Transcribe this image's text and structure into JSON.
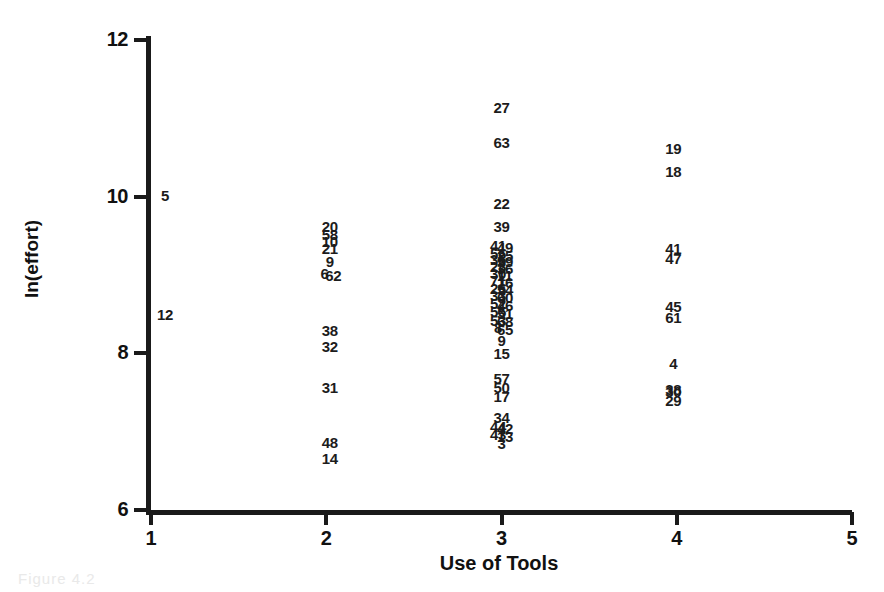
{
  "figure": {
    "caption_faint": "Figure 4.2"
  },
  "axes": {
    "y_title": "ln(effort)",
    "x_title": "Use of Tools",
    "y_ticks": [
      "12",
      "10",
      "8",
      "6"
    ],
    "x_ticks": [
      "1",
      "2",
      "3",
      "4",
      "5"
    ]
  },
  "chart_data": {
    "type": "scatter",
    "title": "",
    "subtitle": "",
    "xlabel": "Use of Tools",
    "ylabel": "ln(effort)",
    "xlim": [
      1,
      5
    ],
    "ylim": [
      6,
      12
    ],
    "grid": false,
    "legend": null,
    "point_style": "case-number-labels",
    "points": [
      {
        "label": "5",
        "x": 1.08,
        "y": 10.02
      },
      {
        "label": "12",
        "x": 1.08,
        "y": 8.5
      },
      {
        "label": "20",
        "x": 2.02,
        "y": 9.62
      },
      {
        "label": "58",
        "x": 2.02,
        "y": 9.52
      },
      {
        "label": "10",
        "x": 2.02,
        "y": 9.43
      },
      {
        "label": "21",
        "x": 2.02,
        "y": 9.34
      },
      {
        "label": "9",
        "x": 2.02,
        "y": 9.18
      },
      {
        "label": "6",
        "x": 1.99,
        "y": 9.02
      },
      {
        "label": "62",
        "x": 2.04,
        "y": 9.0
      },
      {
        "label": "38",
        "x": 2.02,
        "y": 8.3
      },
      {
        "label": "32",
        "x": 2.02,
        "y": 8.09
      },
      {
        "label": "31",
        "x": 2.02,
        "y": 7.57
      },
      {
        "label": "48",
        "x": 2.02,
        "y": 6.87
      },
      {
        "label": "14",
        "x": 2.02,
        "y": 6.66
      },
      {
        "label": "27",
        "x": 3.0,
        "y": 11.15
      },
      {
        "label": "63",
        "x": 3.0,
        "y": 10.7
      },
      {
        "label": "22",
        "x": 3.0,
        "y": 9.92
      },
      {
        "label": "39",
        "x": 3.0,
        "y": 9.62
      },
      {
        "label": "41",
        "x": 2.98,
        "y": 9.38
      },
      {
        "label": "49",
        "x": 3.02,
        "y": 9.36
      },
      {
        "label": "56",
        "x": 2.98,
        "y": 9.28
      },
      {
        "label": "25",
        "x": 3.02,
        "y": 9.26
      },
      {
        "label": "35",
        "x": 2.98,
        "y": 9.2
      },
      {
        "label": "59",
        "x": 3.02,
        "y": 9.18
      },
      {
        "label": "28",
        "x": 2.98,
        "y": 9.11
      },
      {
        "label": "36",
        "x": 3.02,
        "y": 9.09
      },
      {
        "label": "30",
        "x": 2.98,
        "y": 9.02
      },
      {
        "label": "11",
        "x": 3.02,
        "y": 9.0
      },
      {
        "label": "71",
        "x": 2.98,
        "y": 8.93
      },
      {
        "label": "16",
        "x": 3.02,
        "y": 8.91
      },
      {
        "label": "26",
        "x": 2.98,
        "y": 8.84
      },
      {
        "label": "54",
        "x": 3.02,
        "y": 8.82
      },
      {
        "label": "33",
        "x": 2.98,
        "y": 8.74
      },
      {
        "label": "60",
        "x": 3.02,
        "y": 8.72
      },
      {
        "label": "52",
        "x": 2.98,
        "y": 8.64
      },
      {
        "label": "46",
        "x": 3.02,
        "y": 8.62
      },
      {
        "label": "55",
        "x": 2.98,
        "y": 8.54
      },
      {
        "label": "51",
        "x": 3.02,
        "y": 8.52
      },
      {
        "label": "53",
        "x": 2.98,
        "y": 8.43
      },
      {
        "label": "68",
        "x": 3.02,
        "y": 8.41
      },
      {
        "label": "8",
        "x": 2.98,
        "y": 8.33
      },
      {
        "label": "65",
        "x": 3.02,
        "y": 8.31
      },
      {
        "label": "9",
        "x": 3.0,
        "y": 8.17
      },
      {
        "label": "15",
        "x": 3.0,
        "y": 8.0
      },
      {
        "label": "57",
        "x": 3.0,
        "y": 7.68
      },
      {
        "label": "50",
        "x": 3.0,
        "y": 7.57
      },
      {
        "label": "17",
        "x": 3.0,
        "y": 7.46
      },
      {
        "label": "34",
        "x": 3.0,
        "y": 7.19
      },
      {
        "label": "44",
        "x": 2.98,
        "y": 7.07
      },
      {
        "label": "42",
        "x": 3.02,
        "y": 7.05
      },
      {
        "label": "43",
        "x": 2.98,
        "y": 6.97
      },
      {
        "label": "13",
        "x": 3.02,
        "y": 6.95
      },
      {
        "label": "3",
        "x": 3.0,
        "y": 6.86
      },
      {
        "label": "19",
        "x": 3.98,
        "y": 10.62
      },
      {
        "label": "18",
        "x": 3.98,
        "y": 10.33
      },
      {
        "label": "41",
        "x": 3.98,
        "y": 9.34
      },
      {
        "label": "47",
        "x": 3.98,
        "y": 9.22
      },
      {
        "label": "45",
        "x": 3.98,
        "y": 8.6
      },
      {
        "label": "61",
        "x": 3.98,
        "y": 8.46
      },
      {
        "label": "4",
        "x": 3.98,
        "y": 7.88
      },
      {
        "label": "38",
        "x": 3.98,
        "y": 7.55
      },
      {
        "label": "30",
        "x": 3.98,
        "y": 7.52
      },
      {
        "label": "29",
        "x": 3.98,
        "y": 7.41
      }
    ]
  }
}
